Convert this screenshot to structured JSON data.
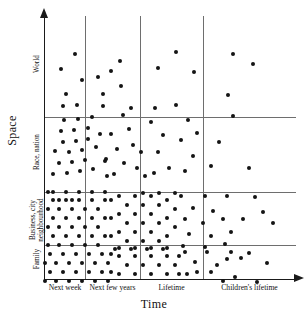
{
  "chart_data": {
    "type": "scatter",
    "title": "",
    "xlabel": "Time",
    "ylabel": "Space",
    "grid": true,
    "legend_position": "none",
    "x_categories": [
      "Next week",
      "Next few years",
      "Lifetime",
      "Children's lifetime"
    ],
    "y_categories": [
      "Family",
      "Business, city neighbourhood",
      "Race, nation",
      "World"
    ],
    "y_category_labels": [
      "Family",
      "Business, city\nneighbourhood",
      "Race, nation",
      "World"
    ],
    "cell_dot_counts": [
      {
        "x": "Next week",
        "y": "Family",
        "count": 44
      },
      {
        "x": "Next few years",
        "y": "Family",
        "count": 31
      },
      {
        "x": "Lifetime",
        "y": "Family",
        "count": 18
      },
      {
        "x": "Children's lifetime",
        "y": "Family",
        "count": 3
      },
      {
        "x": "Next week",
        "y": "Business, city neighbourhood",
        "count": 44
      },
      {
        "x": "Next few years",
        "y": "Business, city neighbourhood",
        "count": 30
      },
      {
        "x": "Lifetime",
        "y": "Business, city neighbourhood",
        "count": 14
      },
      {
        "x": "Children's lifetime",
        "y": "Business, city neighbourhood",
        "count": 4
      },
      {
        "x": "Next week",
        "y": "Race, nation",
        "count": 25
      },
      {
        "x": "Next few years",
        "y": "Race, nation",
        "count": 13
      },
      {
        "x": "Lifetime",
        "y": "Race, nation",
        "count": 12
      },
      {
        "x": "Children's lifetime",
        "y": "Race, nation",
        "count": 4
      },
      {
        "x": "Next week",
        "y": "World",
        "count": 4
      },
      {
        "x": "Next few years",
        "y": "World",
        "count": 5
      },
      {
        "x": "Lifetime",
        "y": "World",
        "count": 3
      },
      {
        "x": "Children's lifetime",
        "y": "World",
        "count": 3
      }
    ],
    "x_gridlines": [
      40,
      95,
      158
    ],
    "y_gridlines": [
      101,
      176,
      229
    ],
    "points": [
      [
        16,
        53
      ],
      [
        30,
        38
      ],
      [
        37,
        64
      ],
      [
        21,
        78
      ],
      [
        53,
        61
      ],
      [
        66,
        55
      ],
      [
        75,
        45
      ],
      [
        76,
        70
      ],
      [
        58,
        78
      ],
      [
        113,
        52
      ],
      [
        131,
        36
      ],
      [
        149,
        56
      ],
      [
        188,
        38
      ],
      [
        208,
        48
      ],
      [
        183,
        79
      ],
      [
        18,
        90
      ],
      [
        32,
        89
      ],
      [
        19,
        104
      ],
      [
        33,
        103
      ],
      [
        47,
        101
      ],
      [
        16,
        115
      ],
      [
        29,
        114
      ],
      [
        43,
        112
      ],
      [
        18,
        126
      ],
      [
        31,
        125
      ],
      [
        43,
        123
      ],
      [
        24,
        136
      ],
      [
        37,
        134
      ],
      [
        14,
        147
      ],
      [
        27,
        146
      ],
      [
        40,
        144
      ],
      [
        22,
        157
      ],
      [
        35,
        155
      ],
      [
        48,
        153
      ],
      [
        10,
        135
      ],
      [
        55,
        118
      ],
      [
        51,
        131
      ],
      [
        60,
        145
      ],
      [
        62,
        160
      ],
      [
        8,
        158
      ],
      [
        58,
        90
      ],
      [
        78,
        99
      ],
      [
        66,
        118
      ],
      [
        84,
        113
      ],
      [
        72,
        133
      ],
      [
        88,
        129
      ],
      [
        61,
        143
      ],
      [
        79,
        147
      ],
      [
        92,
        152
      ],
      [
        69,
        158
      ],
      [
        86,
        92
      ],
      [
        96,
        136
      ],
      [
        100,
        160
      ],
      [
        110,
        92
      ],
      [
        131,
        89
      ],
      [
        106,
        106
      ],
      [
        143,
        104
      ],
      [
        118,
        119
      ],
      [
        136,
        124
      ],
      [
        113,
        136
      ],
      [
        148,
        140
      ],
      [
        124,
        152
      ],
      [
        140,
        155
      ],
      [
        152,
        117
      ],
      [
        109,
        157
      ],
      [
        188,
        100
      ],
      [
        174,
        126
      ],
      [
        166,
        150
      ],
      [
        204,
        152
      ],
      [
        8,
        184
      ],
      [
        21,
        184
      ],
      [
        34,
        184
      ],
      [
        47,
        184
      ],
      [
        60,
        184
      ],
      [
        14,
        193
      ],
      [
        27,
        193
      ],
      [
        40,
        193
      ],
      [
        53,
        193
      ],
      [
        8,
        202
      ],
      [
        21,
        202
      ],
      [
        34,
        202
      ],
      [
        47,
        202
      ],
      [
        60,
        202
      ],
      [
        14,
        211
      ],
      [
        27,
        211
      ],
      [
        40,
        211
      ],
      [
        53,
        211
      ],
      [
        8,
        220
      ],
      [
        21,
        220
      ],
      [
        34,
        220
      ],
      [
        47,
        220
      ],
      [
        60,
        220
      ],
      [
        14,
        229
      ],
      [
        27,
        229
      ],
      [
        40,
        229
      ],
      [
        53,
        229
      ],
      [
        8,
        176
      ],
      [
        21,
        176
      ],
      [
        34,
        176
      ],
      [
        47,
        176
      ],
      [
        60,
        176
      ],
      [
        14,
        184
      ],
      [
        27,
        184
      ],
      [
        3,
        193
      ],
      [
        3,
        211
      ],
      [
        3,
        229
      ],
      [
        3,
        176
      ],
      [
        66,
        184
      ],
      [
        66,
        202
      ],
      [
        66,
        220
      ],
      [
        74,
        180
      ],
      [
        90,
        180
      ],
      [
        106,
        180
      ],
      [
        82,
        189
      ],
      [
        98,
        189
      ],
      [
        114,
        189
      ],
      [
        74,
        198
      ],
      [
        90,
        198
      ],
      [
        106,
        198
      ],
      [
        82,
        207
      ],
      [
        98,
        207
      ],
      [
        114,
        207
      ],
      [
        74,
        216
      ],
      [
        90,
        216
      ],
      [
        106,
        216
      ],
      [
        82,
        225
      ],
      [
        98,
        225
      ],
      [
        114,
        225
      ],
      [
        122,
        184
      ],
      [
        122,
        202
      ],
      [
        122,
        220
      ],
      [
        130,
        193
      ],
      [
        130,
        211
      ],
      [
        130,
        177
      ],
      [
        74,
        232
      ],
      [
        90,
        232
      ],
      [
        106,
        232
      ],
      [
        122,
        232
      ],
      [
        98,
        177
      ],
      [
        114,
        177
      ],
      [
        136,
        180
      ],
      [
        160,
        180
      ],
      [
        182,
        180
      ],
      [
        148,
        192
      ],
      [
        168,
        195
      ],
      [
        140,
        203
      ],
      [
        158,
        207
      ],
      [
        178,
        203
      ],
      [
        144,
        218
      ],
      [
        166,
        220
      ],
      [
        186,
        216
      ],
      [
        138,
        230
      ],
      [
        160,
        231
      ],
      [
        180,
        228
      ],
      [
        210,
        181
      ],
      [
        218,
        196
      ],
      [
        198,
        203
      ],
      [
        228,
        207
      ],
      [
        5,
        238
      ],
      [
        18,
        238
      ],
      [
        31,
        238
      ],
      [
        44,
        238
      ],
      [
        57,
        238
      ],
      [
        11,
        247
      ],
      [
        24,
        247
      ],
      [
        37,
        247
      ],
      [
        50,
        247
      ],
      [
        63,
        247
      ],
      [
        5,
        256
      ],
      [
        18,
        256
      ],
      [
        31,
        256
      ],
      [
        44,
        256
      ],
      [
        57,
        256
      ],
      [
        11,
        265
      ],
      [
        24,
        265
      ],
      [
        37,
        265
      ],
      [
        50,
        265
      ],
      [
        63,
        265
      ],
      [
        5,
        274
      ],
      [
        18,
        274
      ],
      [
        31,
        274
      ],
      [
        44,
        274
      ],
      [
        57,
        274
      ],
      [
        66,
        238
      ],
      [
        66,
        256
      ],
      [
        66,
        274
      ],
      [
        0,
        247
      ],
      [
        0,
        265
      ],
      [
        74,
        240
      ],
      [
        90,
        240
      ],
      [
        106,
        240
      ],
      [
        122,
        240
      ],
      [
        82,
        249
      ],
      [
        98,
        249
      ],
      [
        114,
        249
      ],
      [
        130,
        249
      ],
      [
        74,
        258
      ],
      [
        90,
        258
      ],
      [
        106,
        258
      ],
      [
        122,
        258
      ],
      [
        82,
        267
      ],
      [
        98,
        267
      ],
      [
        114,
        267
      ],
      [
        130,
        267
      ],
      [
        74,
        276
      ],
      [
        90,
        276
      ],
      [
        106,
        276
      ],
      [
        122,
        276
      ],
      [
        70,
        233
      ],
      [
        86,
        233
      ],
      [
        102,
        233
      ],
      [
        118,
        233
      ],
      [
        134,
        240
      ],
      [
        134,
        258
      ],
      [
        134,
        276
      ],
      [
        140,
        236
      ],
      [
        162,
        236
      ],
      [
        186,
        236
      ],
      [
        150,
        246
      ],
      [
        172,
        249
      ],
      [
        196,
        242
      ],
      [
        142,
        258
      ],
      [
        166,
        256
      ],
      [
        190,
        261
      ],
      [
        156,
        268
      ],
      [
        178,
        265
      ],
      [
        144,
        275
      ],
      [
        168,
        277
      ],
      [
        196,
        272
      ],
      [
        152,
        256
      ],
      [
        182,
        243
      ],
      [
        204,
        237
      ],
      [
        222,
        247
      ],
      [
        212,
        266
      ]
    ]
  }
}
